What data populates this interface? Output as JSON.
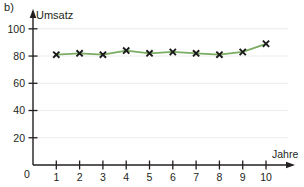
{
  "figure": {
    "panel_label": "b)"
  },
  "chart_data": {
    "type": "line",
    "title": "",
    "subtitle": "",
    "xlabel": "Jahre",
    "ylabel": "Umsatz",
    "x": [
      1,
      2,
      3,
      4,
      5,
      6,
      7,
      8,
      9,
      10
    ],
    "values": [
      81,
      82,
      81,
      84,
      82,
      83,
      82,
      81,
      83,
      89
    ],
    "series": [
      {
        "name": "Umsatz",
        "values": [
          81,
          82,
          81,
          84,
          82,
          83,
          82,
          81,
          83,
          89
        ],
        "color": "#7aad62",
        "marker": "x",
        "marker_color": "#1a1a1a"
      }
    ],
    "xlim": [
      0,
      10.6
    ],
    "ylim": [
      0,
      105
    ],
    "xticks": [
      1,
      2,
      3,
      4,
      5,
      6,
      7,
      8,
      9,
      10
    ],
    "xtick_labels": [
      "1",
      "2",
      "3",
      "4",
      "5",
      "6",
      "7",
      "8",
      "9",
      "10"
    ],
    "yticks": [
      20,
      40,
      60,
      80,
      100
    ],
    "ytick_labels": [
      "20",
      "40",
      "60",
      "80",
      "100"
    ],
    "origin_label": "0",
    "grid": true,
    "grid_color": "#ececec",
    "legend": false,
    "axis_color": "#231f20",
    "axis_arrows": true
  }
}
